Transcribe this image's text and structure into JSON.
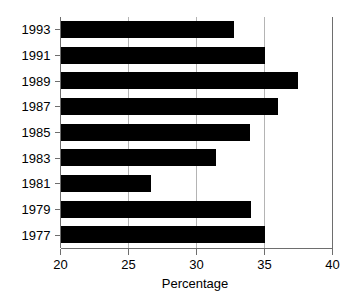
{
  "chart_data": {
    "type": "bar",
    "orientation": "horizontal",
    "title": "",
    "xlabel": "Percentage",
    "ylabel": "",
    "categories": [
      "1993",
      "1991",
      "1989",
      "1987",
      "1985",
      "1983",
      "1981",
      "1979",
      "1977"
    ],
    "values": [
      32.8,
      35.1,
      37.5,
      36.1,
      34.0,
      31.5,
      26.7,
      34.1,
      35.1
    ],
    "xlim": [
      20,
      40
    ],
    "xticks": [
      20,
      25,
      30,
      35,
      40
    ],
    "xtick_labels": [
      "20",
      "25",
      "30",
      "35",
      "40"
    ],
    "ytick_labels": [
      "1993",
      "1991",
      "1989",
      "1987",
      "1985",
      "1983",
      "1981",
      "1979",
      "1977"
    ],
    "grid": true,
    "grid_axis": "x",
    "legend": null,
    "bar_color": "#000000",
    "grid_color": "#b4b4b4",
    "axis_color": "#6e6e6e",
    "background_color": "#ffffff"
  },
  "axes": {
    "x_axis_title": "Percentage"
  }
}
